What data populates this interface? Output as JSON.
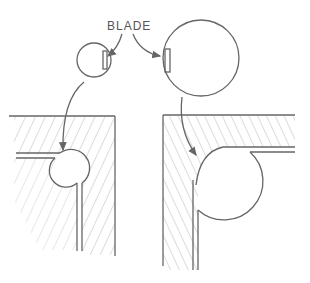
{
  "diagram": {
    "label": "BLADE",
    "colors": {
      "line": "#666666",
      "hatch": "#999999",
      "background": "#ffffff"
    },
    "elements": [
      {
        "id": "small-blade-circle",
        "description": "small circular cutter with blade"
      },
      {
        "id": "large-blade-circle",
        "description": "large circular cutter with blade"
      },
      {
        "id": "left-section",
        "description": "hatched corner section with small round groove"
      },
      {
        "id": "right-section",
        "description": "hatched corner section with large round groove"
      }
    ]
  }
}
